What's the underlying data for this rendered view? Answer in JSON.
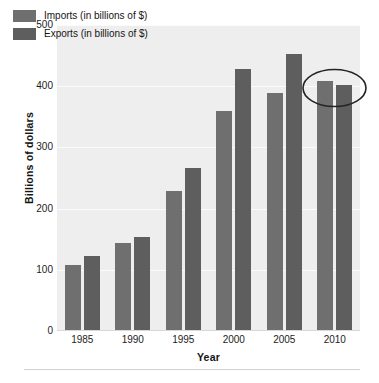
{
  "chart_data": {
    "type": "bar",
    "title": "",
    "xlabel": "Year",
    "ylabel": "Billions of dollars",
    "categories": [
      "1985",
      "1990",
      "1995",
      "2000",
      "2005",
      "2010"
    ],
    "series": [
      {
        "name": "Imports (in billions of $)",
        "short_name": "Imports",
        "color": "#6f6f6f",
        "values": [
          108,
          144,
          229,
          360,
          389,
          408
        ]
      },
      {
        "name": "Exports (in billions of $)",
        "short_name": "Exports",
        "color": "#5e5e5e",
        "values": [
          123,
          154,
          267,
          428,
          452,
          402
        ]
      }
    ],
    "ylim": [
      0,
      500
    ],
    "yticks": [
      0,
      100,
      200,
      300,
      400,
      500
    ],
    "ytick_labels": [
      "0",
      "100",
      "200",
      "300",
      "400",
      "500"
    ],
    "grid": true,
    "grid_axis": "y",
    "legend_position": "upper-left",
    "plot_background": "#eeeeee",
    "annotations": [
      {
        "kind": "ellipse",
        "label": "highlight-2010-pair",
        "target_category": "2010"
      }
    ]
  },
  "legend": {
    "items": [
      {
        "label": "Imports (in billions of $)",
        "swatch": "imports-swatch"
      },
      {
        "label": "Exports (in billions of $)",
        "swatch": "exports-swatch"
      }
    ]
  },
  "footer": {
    "caption_fragment": ""
  }
}
